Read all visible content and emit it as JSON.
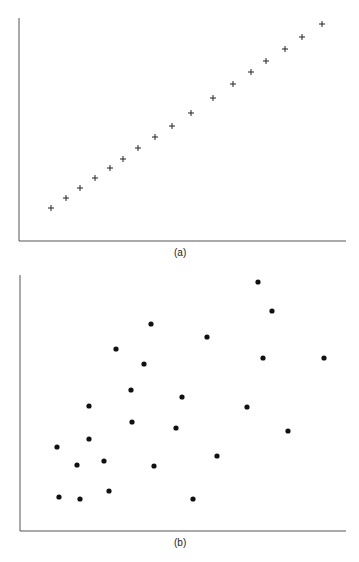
{
  "chart_data": [
    {
      "type": "scatter",
      "panel_label": "(a)",
      "title": "",
      "xlabel": "",
      "ylabel": "",
      "marker": "plus",
      "grid": false,
      "axis_frame": {
        "left": 19,
        "top": 18,
        "right": 346,
        "bottom": 241
      },
      "points_px": [
        [
          51,
          208
        ],
        [
          66,
          198
        ],
        [
          80,
          188
        ],
        [
          95,
          178
        ],
        [
          110,
          168
        ],
        [
          123,
          159
        ],
        [
          138,
          148
        ],
        [
          155,
          137
        ],
        [
          172,
          126
        ],
        [
          191,
          113
        ],
        [
          213,
          98
        ],
        [
          233,
          84
        ],
        [
          251,
          72
        ],
        [
          266,
          61
        ],
        [
          285,
          49
        ],
        [
          302,
          37
        ],
        [
          322,
          24
        ]
      ]
    },
    {
      "type": "scatter",
      "panel_label": "(b)",
      "title": "",
      "xlabel": "",
      "ylabel": "",
      "marker": "dot",
      "grid": false,
      "axis_frame": {
        "left": 20,
        "top": 275,
        "right": 346,
        "bottom": 531
      },
      "points_px": [
        [
          258,
          282
        ],
        [
          272,
          311
        ],
        [
          151,
          324
        ],
        [
          207,
          337
        ],
        [
          116,
          349
        ],
        [
          144,
          364
        ],
        [
          263,
          358
        ],
        [
          324,
          358
        ],
        [
          131,
          390
        ],
        [
          182,
          397
        ],
        [
          89,
          406
        ],
        [
          247,
          407
        ],
        [
          132,
          422
        ],
        [
          176,
          428
        ],
        [
          288,
          431
        ],
        [
          89,
          439
        ],
        [
          57,
          447
        ],
        [
          104,
          461
        ],
        [
          77,
          465
        ],
        [
          154,
          466
        ],
        [
          217,
          456
        ],
        [
          109,
          491
        ],
        [
          59,
          497
        ],
        [
          80,
          499
        ],
        [
          193,
          499
        ]
      ]
    }
  ],
  "labels": {
    "panel_a": "(a)",
    "panel_b": "(b)"
  }
}
